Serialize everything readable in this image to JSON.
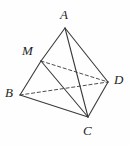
{
  "figure": {
    "name": "tetrahedron-abcd-with-point-m",
    "width": 130,
    "height": 146,
    "background_color": "#fefefe",
    "stroke_color": "#3a3a3a",
    "label_color": "#1d1d1d"
  },
  "vertices": [
    {
      "id": "A",
      "label": "A",
      "x": 65,
      "y": 28,
      "label_x": 60,
      "label_y": 8
    },
    {
      "id": "M",
      "label": "M",
      "x": 41,
      "y": 61,
      "label_x": 22,
      "label_y": 44
    },
    {
      "id": "B",
      "label": "B",
      "x": 20,
      "y": 95,
      "label_x": 5,
      "label_y": 86
    },
    {
      "id": "C",
      "label": "C",
      "x": 88,
      "y": 117,
      "label_x": 83,
      "label_y": 124
    },
    {
      "id": "D",
      "label": "D",
      "x": 108,
      "y": 82,
      "label_x": 114,
      "label_y": 73
    }
  ],
  "edges": [
    {
      "id": "AM",
      "from": "A",
      "to": "M",
      "style": "solid"
    },
    {
      "id": "MB",
      "from": "M",
      "to": "B",
      "style": "solid"
    },
    {
      "id": "AC",
      "from": "A",
      "to": "C",
      "style": "solid"
    },
    {
      "id": "AD",
      "from": "A",
      "to": "D",
      "style": "solid"
    },
    {
      "id": "BC",
      "from": "B",
      "to": "C",
      "style": "solid"
    },
    {
      "id": "CD",
      "from": "C",
      "to": "D",
      "style": "solid"
    },
    {
      "id": "MC",
      "from": "M",
      "to": "C",
      "style": "solid"
    },
    {
      "id": "BD",
      "from": "B",
      "to": "D",
      "style": "dashed"
    },
    {
      "id": "MD",
      "from": "M",
      "to": "D",
      "style": "dashed"
    }
  ]
}
